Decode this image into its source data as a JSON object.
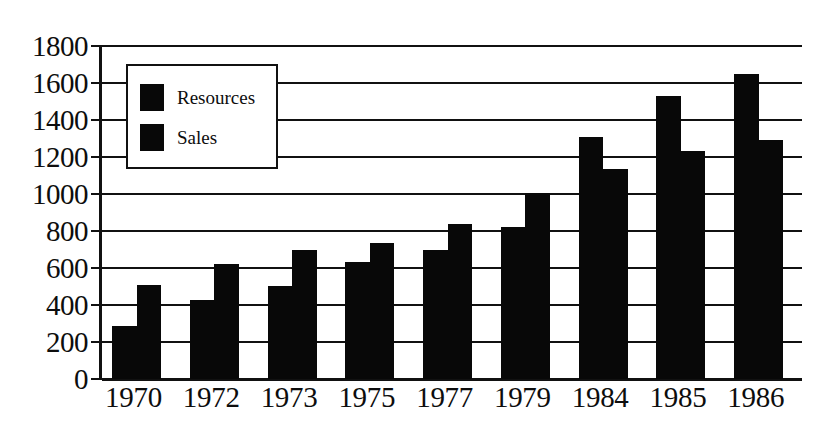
{
  "chart_data": {
    "type": "bar",
    "title": "",
    "subtitle": "",
    "xlabel": "",
    "ylabel": "",
    "categories": [
      "1970",
      "1972",
      "1973",
      "1975",
      "1977",
      "1979",
      "1984",
      "1985",
      "1986"
    ],
    "series": [
      {
        "name": "Resources",
        "color": "#080808",
        "values": [
          285,
          425,
          505,
          635,
          700,
          820,
          1310,
          1530,
          1650
        ]
      },
      {
        "name": "Sales",
        "color": "#080808",
        "values": [
          510,
          620,
          700,
          735,
          840,
          1005,
          1135,
          1235,
          1290
        ]
      }
    ],
    "ylim": [
      0,
      1800
    ],
    "ytick_values": [
      0,
      200,
      400,
      600,
      800,
      1000,
      1200,
      1400,
      1600,
      1800
    ],
    "ytick_labels": [
      "0",
      "200",
      "400",
      "600",
      "800",
      "1000",
      "1200",
      "1400",
      "1600",
      "1800"
    ],
    "xtick_labels": [
      "1970",
      "1972",
      "1973",
      "1975",
      "1977",
      "1979",
      "1984",
      "1985",
      "1986"
    ],
    "grid": true,
    "grid_axis": "y",
    "legend": {
      "position": "upper-left-inside",
      "entries": [
        "Resources",
        "Sales"
      ]
    },
    "bar_layout": "grouped",
    "annotations": []
  },
  "legend": {
    "items": [
      {
        "label": "Resources",
        "swatch_color": "#080808"
      },
      {
        "label": "Sales",
        "swatch_color": "#080808"
      }
    ]
  },
  "axes": {
    "y": {
      "labels": [
        "1800",
        "1600",
        "1400",
        "1200",
        "1000",
        "800",
        "600",
        "400",
        "200",
        "0"
      ],
      "values": [
        1800,
        1600,
        1400,
        1200,
        1000,
        800,
        600,
        400,
        200,
        0
      ]
    },
    "x": {
      "labels": [
        "1970",
        "1972",
        "1973",
        "1975",
        "1977",
        "1979",
        "1984",
        "1985",
        "1986"
      ]
    }
  },
  "style": {
    "bar_color": "#080808",
    "axis_color": "#111111",
    "background": "#ffffff"
  }
}
